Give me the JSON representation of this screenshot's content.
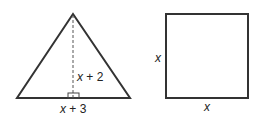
{
  "figures": {
    "triangle": {
      "height_label": "x + 2",
      "base_label": "x + 3",
      "height_var": "x",
      "height_rest": " + 2",
      "base_var": "x",
      "base_rest": " + 3"
    },
    "square": {
      "side_label_left": "x",
      "side_label_bottom": "x"
    }
  },
  "colors": {
    "stroke": "#333333",
    "text": "#222222"
  }
}
